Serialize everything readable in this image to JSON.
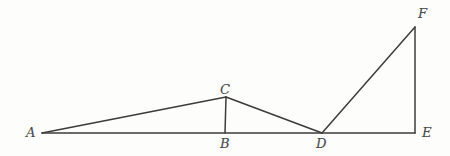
{
  "figure": {
    "canvas": {
      "width": 450,
      "height": 156
    },
    "background_color": "#fdfdfc",
    "stroke_color": "#3c3c3c",
    "stroke_width": 1.5,
    "label_color": "#4a4a4a",
    "vertices": [
      {
        "id": "A",
        "label": "A",
        "x": 42,
        "y": 133,
        "label_x": 26,
        "label_y": 126
      },
      {
        "id": "B",
        "label": "B",
        "x": 225,
        "y": 133,
        "label_x": 220,
        "label_y": 137
      },
      {
        "id": "C",
        "label": "C",
        "x": 226,
        "y": 97,
        "label_x": 220,
        "label_y": 83
      },
      {
        "id": "D",
        "label": "D",
        "x": 322,
        "y": 133,
        "label_x": 316,
        "label_y": 137
      },
      {
        "id": "E",
        "label": "E",
        "x": 415,
        "y": 133,
        "label_x": 422,
        "label_y": 126
      },
      {
        "id": "F",
        "label": "F",
        "x": 415,
        "y": 27,
        "label_x": 418,
        "label_y": 7
      }
    ],
    "segments": [
      {
        "id": "A-E",
        "from": "A",
        "to": "E",
        "name": "baseline-segment"
      },
      {
        "id": "A-C",
        "from": "A",
        "to": "C",
        "name": "segment-a-to-c"
      },
      {
        "id": "B-C",
        "from": "B",
        "to": "C",
        "name": "altitude-segment-b-to-c"
      },
      {
        "id": "C-D",
        "from": "C",
        "to": "D",
        "name": "segment-c-to-d"
      },
      {
        "id": "D-F",
        "from": "D",
        "to": "F",
        "name": "segment-d-to-f"
      },
      {
        "id": "E-F",
        "from": "E",
        "to": "F",
        "name": "vertical-segment-e-to-f"
      }
    ]
  }
}
